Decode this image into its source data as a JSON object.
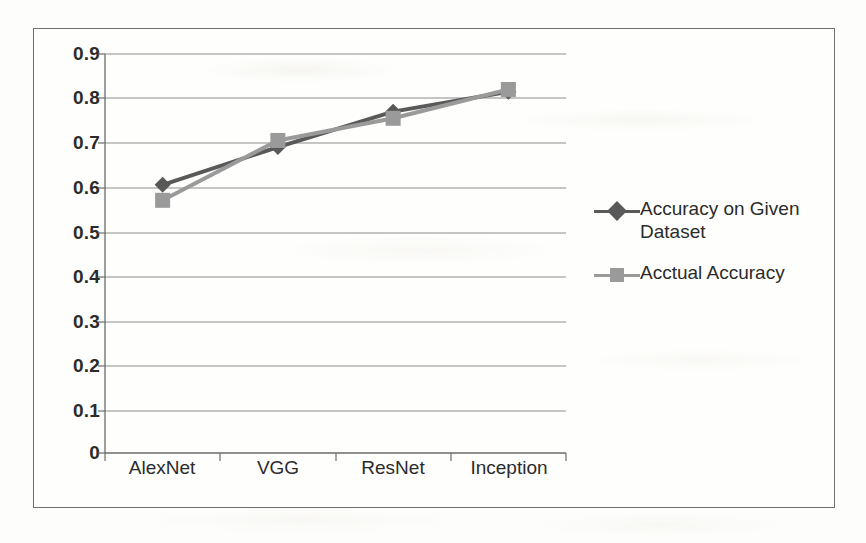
{
  "chart_data": {
    "type": "line",
    "title": "",
    "xlabel": "",
    "ylabel": "",
    "categories": [
      "AlexNet",
      "VGG",
      "ResNet",
      "Inception"
    ],
    "ylim": [
      0,
      0.9
    ],
    "y_ticks": [
      "0",
      "0.1",
      "0.2",
      "0.3",
      "0.4",
      "0.5",
      "0.6",
      "0.7",
      "0.8",
      "0.9"
    ],
    "y_tick_values": [
      0,
      0.1,
      0.2,
      0.3,
      0.4,
      0.5,
      0.6,
      0.7,
      0.8,
      0.9
    ],
    "grid": "horizontal",
    "legend_position": "right",
    "series": [
      {
        "name": "Accuracy on Given Dataset",
        "values": [
          0.605,
          0.69,
          0.77,
          0.815
        ],
        "color": "#595959",
        "marker": "diamond"
      },
      {
        "name": "Acctual Accuracy",
        "values": [
          0.57,
          0.705,
          0.755,
          0.82
        ],
        "color": "#9a9a9a",
        "marker": "square"
      }
    ]
  },
  "legend": {
    "items": [
      {
        "label": "Accuracy on Given Dataset"
      },
      {
        "label": "Acctual Accuracy"
      }
    ]
  }
}
